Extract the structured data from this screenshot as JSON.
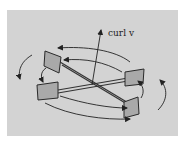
{
  "figure": {
    "label": "curl v",
    "colors": {
      "background": "#d3d3d3",
      "paddle_fill": "#a9a9a9",
      "paddle_stroke": "#2a2a2a",
      "ink": "#222222"
    },
    "parts": {
      "paddles": 4,
      "axis_arrow": "curl-vector",
      "circulation_arrows": "counterclockwise"
    }
  }
}
